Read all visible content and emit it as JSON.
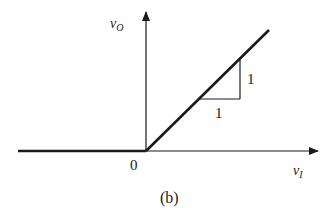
{
  "diagram": {
    "y_axis_label": "v",
    "y_axis_subscript": "O",
    "x_axis_label": "v",
    "x_axis_subscript": "I",
    "origin_label": "0",
    "slope_run_label": "1",
    "slope_rise_label": "1",
    "caption": "(b)",
    "line_color": "#1a1a1a",
    "transfer_characteristic": {
      "description": "v_O = 0 for v_I < 0; v_O = v_I for v_I >= 0",
      "slope": 1
    }
  }
}
